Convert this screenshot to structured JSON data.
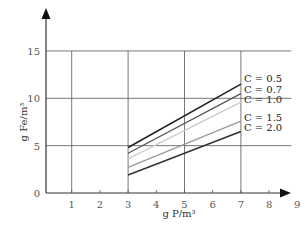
{
  "chart_data": {
    "type": "line",
    "title": "",
    "xlabel": "g P/m³",
    "ylabel": "g Fe/m³",
    "xlim": [
      0,
      9
    ],
    "ylim": [
      0,
      15
    ],
    "xticks": [
      "1",
      "2",
      "3",
      "4",
      "5",
      "6",
      "7",
      "8",
      "9"
    ],
    "yticks": [
      "0",
      "5",
      "10",
      "15"
    ],
    "grid": {
      "x": [
        1,
        3,
        5,
        7
      ],
      "y": [
        5,
        10,
        15
      ]
    },
    "legend_position": "right, inline at line ends",
    "series": [
      {
        "name": "C = 0.5",
        "x": [
          3,
          7
        ],
        "y": [
          4.8,
          11.5
        ],
        "color": "#222222",
        "width": 1.6
      },
      {
        "name": "C = 0.7",
        "x": [
          3,
          7
        ],
        "y": [
          4.2,
          10.5
        ],
        "color": "#555555",
        "width": 1.3
      },
      {
        "name": "C = 1.0",
        "x": [
          3,
          7
        ],
        "y": [
          3.6,
          9.6
        ],
        "color": "#cccccc",
        "width": 1.3
      },
      {
        "name": "C = 1.5",
        "x": [
          3,
          7
        ],
        "y": [
          2.7,
          7.6
        ],
        "color": "#999999",
        "width": 1.3
      },
      {
        "name": "C = 2.0",
        "x": [
          3,
          7
        ],
        "y": [
          1.9,
          6.5
        ],
        "color": "#333333",
        "width": 1.6
      }
    ]
  }
}
